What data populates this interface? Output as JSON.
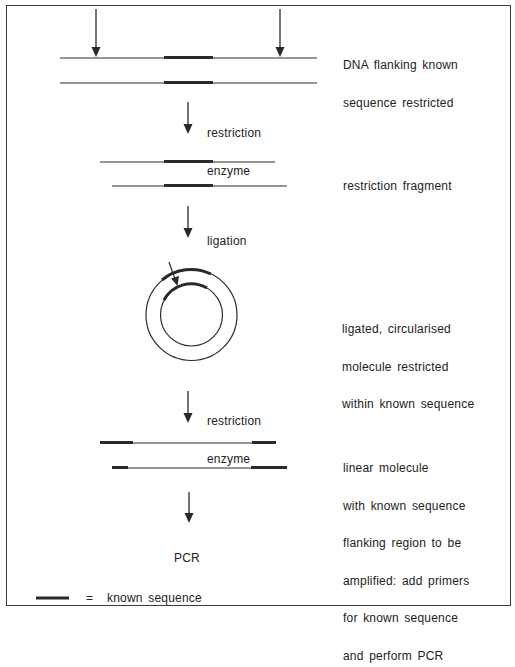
{
  "diagram": {
    "steps": [
      {
        "id": "step1",
        "description": [
          "DNA flanking known",
          "sequence restricted"
        ]
      },
      {
        "id": "arrow1",
        "label": [
          "restriction",
          "enzyme"
        ]
      },
      {
        "id": "step2",
        "description": [
          "restriction fragment"
        ]
      },
      {
        "id": "arrow2",
        "label": [
          "ligation"
        ]
      },
      {
        "id": "step3",
        "description": [
          "ligated, circularised",
          "molecule restricted",
          "within known sequence"
        ]
      },
      {
        "id": "arrow3",
        "label": [
          "restriction",
          "enzyme"
        ]
      },
      {
        "id": "step4",
        "description": [
          "linear molecule",
          "with known sequence",
          "flanking region to be",
          "amplified: add primers",
          "for known sequence",
          "and perform PCR"
        ]
      },
      {
        "id": "result",
        "label": "PCR"
      }
    ],
    "legend": {
      "equals": "=",
      "text": "known sequence"
    }
  },
  "colors": {
    "line": "#2a2a2a",
    "border": "#3a3a3a",
    "background": "#ffffff"
  }
}
